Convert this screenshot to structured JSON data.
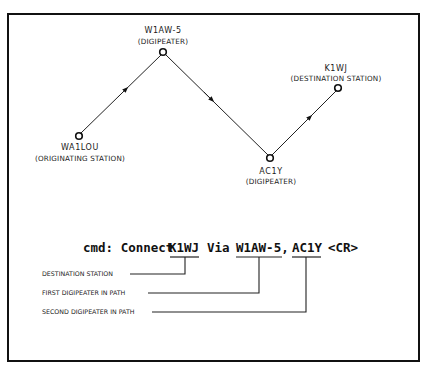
{
  "diagram": {
    "nodes": [
      {
        "id": "wa1lou",
        "call": "WA1LOU",
        "role": "(ORIGINATING STATION)",
        "x": 79,
        "y": 136
      },
      {
        "id": "w1aw5",
        "call": "W1AW-5",
        "role": "(DIGIPEATER)",
        "x": 163,
        "y": 52
      },
      {
        "id": "ac1y",
        "call": "AC1Y",
        "role": "(DIGIPEATER)",
        "x": 270,
        "y": 158
      },
      {
        "id": "k1wj",
        "call": "K1WJ",
        "role": "(DESTINATION STATION)",
        "x": 338,
        "y": 88
      }
    ],
    "edges": [
      {
        "from": "wa1lou",
        "to": "w1aw5",
        "direction": "forward"
      },
      {
        "from": "w1aw5",
        "to": "ac1y",
        "direction": "forward"
      },
      {
        "from": "ac1y",
        "to": "k1wj",
        "direction": "forward"
      }
    ]
  },
  "command": {
    "prefix": "cmd: Connect",
    "destination": "K1WJ",
    "via": "Via",
    "digi1": "W1AW-5,",
    "digi2": "AC1Y",
    "terminator": "<CR>"
  },
  "annotations": [
    {
      "label": "DESTINATION STATION",
      "target": "K1WJ"
    },
    {
      "label": "FIRST DIGIPEATER IN PATH",
      "target": "W1AW-5"
    },
    {
      "label": "SECOND DIGIPEATER IN PATH",
      "target": "AC1Y"
    }
  ]
}
